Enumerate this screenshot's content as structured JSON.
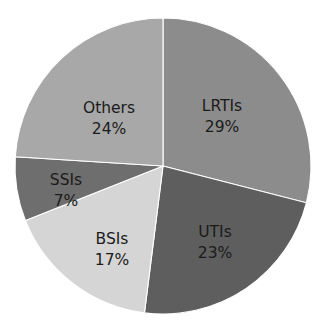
{
  "chart_data": {
    "type": "pie",
    "title": "",
    "subtitle": "",
    "xlabel": "",
    "ylabel": "",
    "grid": false,
    "legend": "none",
    "units": "percent",
    "start_angle_deg": 0,
    "direction": "clockwise",
    "total": 100,
    "categories": [
      "LRTIs",
      "UTIs",
      "BSIs",
      "SSIs",
      "Others"
    ],
    "values": [
      29,
      23,
      17,
      7,
      24
    ],
    "slices": [
      {
        "label": "LRTIs",
        "value": 29,
        "value_text": "29%",
        "color": "#8c8c8c",
        "label_x": 222,
        "label_y": 106
      },
      {
        "label": "UTIs",
        "value": 23,
        "value_text": "23%",
        "color": "#5e5e5e",
        "label_x": 215,
        "label_y": 232
      },
      {
        "label": "BSIs",
        "value": 17,
        "value_text": "17%",
        "color": "#d5d5d5",
        "label_x": 112,
        "label_y": 239
      },
      {
        "label": "SSIs",
        "value": 7,
        "value_text": "7%",
        "color": "#6e6e6e",
        "label_x": 66,
        "label_y": 180
      },
      {
        "label": "Others",
        "value": 24,
        "value_text": "24%",
        "color": "#a8a8a8",
        "label_x": 109,
        "label_y": 108
      }
    ],
    "geometry": {
      "center_x": 163,
      "center_y": 166,
      "radius": 148
    },
    "colors": {
      "background": "#ffffff",
      "label_text": "#1b1b1b",
      "slice_border": "#ffffff"
    }
  }
}
